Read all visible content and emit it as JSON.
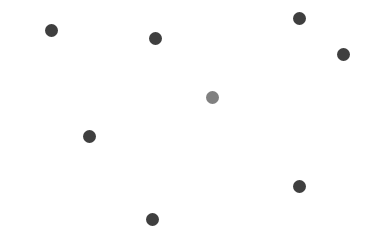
{
  "figure": {
    "width": 376,
    "height": 247,
    "background_color": "#ffffff",
    "axes_visible": false,
    "gridlines_visible": false,
    "title": "",
    "xlabel": "",
    "ylabel": ""
  },
  "colors": {
    "point_default": "#3f3f3f",
    "point_highlight": "#808080",
    "background": "#ffffff"
  },
  "chart_data": {
    "type": "scatter",
    "title": "",
    "xlabel": "",
    "ylabel": "",
    "xlim": [
      0,
      376
    ],
    "ylim": [
      0,
      247
    ],
    "grid": false,
    "legend": null,
    "marker": "circle",
    "marker_size": 13,
    "point_count": 8,
    "series": [
      {
        "name": "points",
        "color": "#3f3f3f",
        "points": [
          {
            "x": 51,
            "y": 30,
            "size": 13,
            "color": "#3f3f3f",
            "highlight": false
          },
          {
            "x": 155,
            "y": 38,
            "size": 13,
            "color": "#3f3f3f",
            "highlight": false
          },
          {
            "x": 299,
            "y": 18,
            "size": 13,
            "color": "#3f3f3f",
            "highlight": false
          },
          {
            "x": 343,
            "y": 54,
            "size": 13,
            "color": "#3f3f3f",
            "highlight": false
          },
          {
            "x": 212,
            "y": 97,
            "size": 13,
            "color": "#808080",
            "highlight": true
          },
          {
            "x": 89,
            "y": 136,
            "size": 13,
            "color": "#3f3f3f",
            "highlight": false
          },
          {
            "x": 299,
            "y": 186,
            "size": 13,
            "color": "#3f3f3f",
            "highlight": false
          },
          {
            "x": 152,
            "y": 219,
            "size": 13,
            "color": "#3f3f3f",
            "highlight": false
          }
        ]
      }
    ]
  }
}
